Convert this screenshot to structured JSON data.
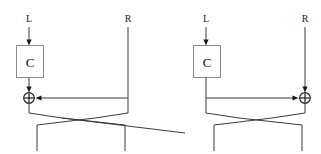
{
  "figure": {
    "stroke_color": "#3a3a3a",
    "box_stroke_color": "#8a8a8a",
    "node_color": "#1a1a1a",
    "background": "#ffffff"
  },
  "panels": [
    {
      "id": "left-panel",
      "orientation": "function-on-left",
      "labels": {
        "left_input": "L",
        "right_input": "R",
        "function_box": "C",
        "xor_symbol": "+"
      },
      "geometry": {
        "left_rail_x": 29,
        "right_rail_x": 128,
        "rail_top_y": 26,
        "box": {
          "x": 16,
          "y": 45,
          "w": 28,
          "h": 33
        },
        "xor": {
          "cx": 29,
          "cy": 98,
          "r": 5.5
        },
        "bus_y": 98,
        "cross_top_y": 113,
        "cross_bottom_y": 133,
        "rail_bottom_y": 151
      }
    },
    {
      "id": "right-panel",
      "orientation": "function-on-left-xor-on-right",
      "labels": {
        "left_input": "L",
        "right_input": "R",
        "function_box": "C",
        "xor_symbol": "+"
      },
      "geometry": {
        "left_rail_x": 206,
        "right_rail_x": 305,
        "rail_top_y": 26,
        "box": {
          "x": 193,
          "y": 45,
          "w": 28,
          "h": 33
        },
        "xor": {
          "cx": 305,
          "cy": 98,
          "r": 5.5
        },
        "bus_y": 98,
        "cross_top_y": 113,
        "cross_bottom_y": 133,
        "rail_bottom_y": 151
      }
    }
  ]
}
